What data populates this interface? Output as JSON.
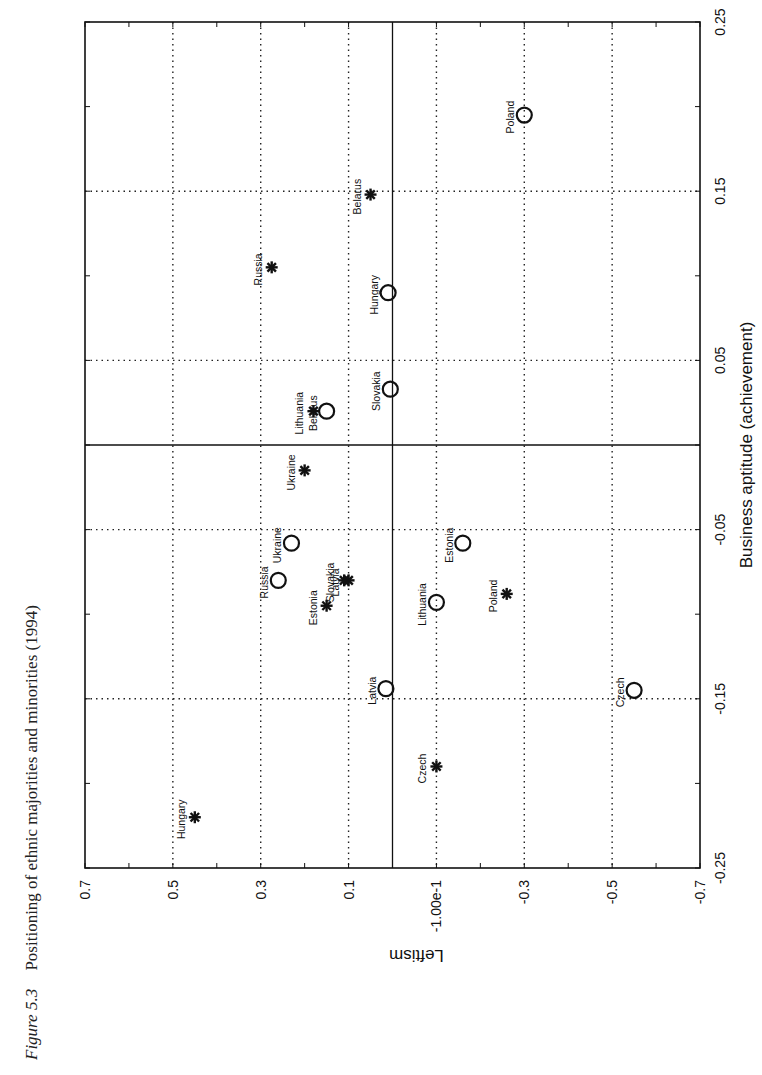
{
  "caption": {
    "figure_label": "Figure 5.3",
    "text": "Positioning of ethnic majorities and minorities (1994)"
  },
  "chart_data": {
    "type": "scatter",
    "title": "Positioning of ethnic majorities and minorities (1994)",
    "orientation_note": "page rotated 90 degrees; Leftism axis runs along page width, Business aptitude along page height",
    "xlabel": "Business aptitude (achievement)",
    "ylabel": "Leftism",
    "xlim": [
      -0.25,
      0.25
    ],
    "ylim": [
      -0.7,
      0.7
    ],
    "x_ticks": [
      "-0.25",
      "-0.15",
      "-0.05",
      "0.05",
      "0.15",
      "0.25"
    ],
    "y_ticks": [
      "0.7",
      "0.5",
      "0.3",
      "0.1",
      "-1.00e-1",
      "-0.3",
      "-0.5",
      "-0.7"
    ],
    "grid": true,
    "reference_lines": {
      "x": 0,
      "y": 0
    },
    "series": [
      {
        "name": "majorities",
        "marker": "circle",
        "points": [
          {
            "label": "Poland",
            "x": 0.195,
            "y": -0.3
          },
          {
            "label": "Hungary",
            "x": 0.09,
            "y": 0.01
          },
          {
            "label": "Slovakia",
            "x": 0.033,
            "y": 0.005
          },
          {
            "label": "Belarus",
            "x": 0.02,
            "y": 0.15
          },
          {
            "label": "Ukraine",
            "x": -0.058,
            "y": 0.23
          },
          {
            "label": "Russia",
            "x": -0.08,
            "y": 0.26
          },
          {
            "label": "Estonia",
            "x": -0.058,
            "y": -0.16
          },
          {
            "label": "Lithuania",
            "x": -0.093,
            "y": -0.1
          },
          {
            "label": "Latvia",
            "x": -0.144,
            "y": 0.015
          },
          {
            "label": "Czech",
            "x": -0.145,
            "y": -0.55
          }
        ]
      },
      {
        "name": "minorities",
        "marker": "asterisk",
        "points": [
          {
            "label": "Belarus",
            "x": 0.148,
            "y": 0.05
          },
          {
            "label": "Russia",
            "x": 0.105,
            "y": 0.275
          },
          {
            "label": "Lithuania",
            "x": 0.02,
            "y": 0.18
          },
          {
            "label": "Ukraine",
            "x": -0.015,
            "y": 0.2
          },
          {
            "label": "Slovakia",
            "x": -0.08,
            "y": 0.11
          },
          {
            "label": "Latvia",
            "x": -0.08,
            "y": 0.1
          },
          {
            "label": "Estonia",
            "x": -0.095,
            "y": 0.15
          },
          {
            "label": "Poland",
            "x": -0.088,
            "y": -0.26
          },
          {
            "label": "Czech",
            "x": -0.19,
            "y": -0.1
          },
          {
            "label": "Hungary",
            "x": -0.22,
            "y": 0.45
          }
        ]
      }
    ]
  }
}
